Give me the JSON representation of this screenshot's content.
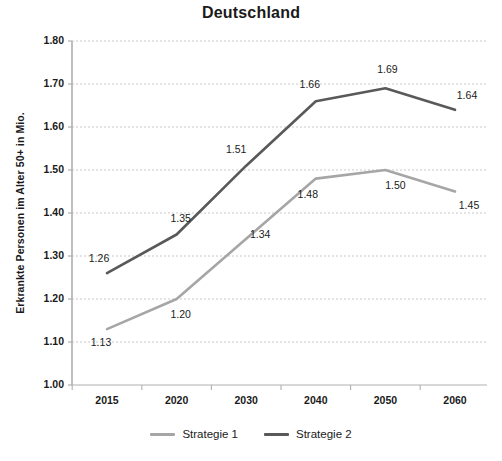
{
  "chart_data": {
    "type": "line",
    "title": "Deutschland",
    "xlabel": "",
    "ylabel": "Erkrankte Personen im Alter 50+ in Mio.",
    "categories": [
      "2015",
      "2020",
      "2030",
      "2040",
      "2050",
      "2060"
    ],
    "ylim": [
      1.0,
      1.8
    ],
    "ytick_step": 0.1,
    "yticks": [
      "1.80",
      "1.70",
      "1.60",
      "1.50",
      "1.40",
      "1.30",
      "1.20",
      "1.10",
      "1.00"
    ],
    "grid": true,
    "legend_position": "bottom",
    "series": [
      {
        "name": "Strategie 1",
        "color": "#a6a6a6",
        "values": [
          1.13,
          1.2,
          1.34,
          1.48,
          1.5,
          1.45
        ],
        "labels": [
          "1.13",
          "1.20",
          "1.34",
          "1.48",
          "1.50",
          "1.45"
        ]
      },
      {
        "name": "Strategie 2",
        "color": "#595959",
        "values": [
          1.26,
          1.35,
          1.51,
          1.66,
          1.69,
          1.64
        ],
        "labels": [
          "1.26",
          "1.35",
          "1.51",
          "1.66",
          "1.69",
          "1.64"
        ]
      }
    ]
  },
  "axis": {
    "y_ticks": [
      {
        "label": "1.80"
      },
      {
        "label": "1.70"
      },
      {
        "label": "1.60"
      },
      {
        "label": "1.50"
      },
      {
        "label": "1.40"
      },
      {
        "label": "1.30"
      },
      {
        "label": "1.20"
      },
      {
        "label": "1.10"
      },
      {
        "label": "1.00"
      }
    ],
    "x_ticks": [
      {
        "label": "2015"
      },
      {
        "label": "2020"
      },
      {
        "label": "2030"
      },
      {
        "label": "2040"
      },
      {
        "label": "2050"
      },
      {
        "label": "2060"
      }
    ]
  },
  "legend": {
    "items": [
      {
        "label": "Strategie 1",
        "color": "#a6a6a6"
      },
      {
        "label": "Strategie 2",
        "color": "#595959"
      }
    ]
  },
  "colors": {
    "series1": "#a6a6a6",
    "series2": "#595959",
    "grid": "#c9c9c9",
    "axis": "#b0b0b0",
    "text": "#1a1a1a",
    "background": "#ffffff"
  }
}
